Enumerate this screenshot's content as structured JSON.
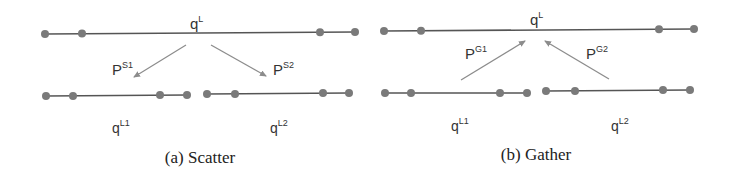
{
  "colors": {
    "line": "#555555",
    "dot": "#7a7a7a",
    "arrow": "#8c8c8c",
    "text": "#333333"
  },
  "scatter": {
    "caption": "(a) Scatter",
    "top_label": {
      "base": "q",
      "sup": "L"
    },
    "arrow_left_label": {
      "base": "P",
      "sup": "S1"
    },
    "arrow_right_label": {
      "base": "P",
      "sup": "S2"
    },
    "bottom_left_label": {
      "base": "q",
      "sup": "L1"
    },
    "bottom_right_label": {
      "base": "q",
      "sup": "L2"
    }
  },
  "gather": {
    "caption": "(b) Gather",
    "top_label": {
      "base": "q",
      "sup": "L"
    },
    "arrow_left_label": {
      "base": "P",
      "sup": "G1"
    },
    "arrow_right_label": {
      "base": "P",
      "sup": "G2"
    },
    "bottom_left_label": {
      "base": "q",
      "sup": "L1"
    },
    "bottom_right_label": {
      "base": "q",
      "sup": "L2"
    }
  }
}
